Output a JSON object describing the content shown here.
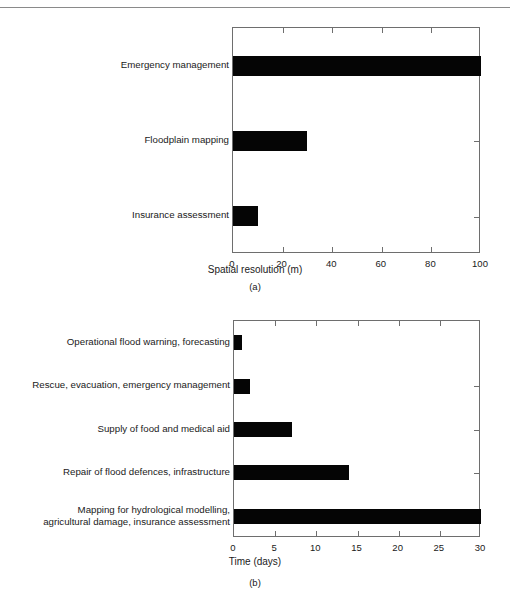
{
  "page": {
    "background_color": "#ffffff",
    "rule_color": "#8a8a8a",
    "bar_color": "#050505",
    "axis_color": "#6e6e6e",
    "text_color": "#1a1a1a",
    "footer_text_clipped": ""
  },
  "chart_data": [
    {
      "type": "bar",
      "orientation": "horizontal",
      "panel": "(a)",
      "title": "",
      "xlabel": "Spatial resolution (m)",
      "ylabel": "",
      "xlim": [
        0,
        100
      ],
      "xticks": [
        "0",
        "20",
        "40",
        "60",
        "80",
        "100"
      ],
      "xtick_values": [
        0,
        20,
        40,
        60,
        80,
        100
      ],
      "grid": false,
      "legend": false,
      "categories": [
        "Emergency management",
        "Floodplain mapping",
        "Insurance assessment"
      ],
      "values": [
        100,
        30,
        10
      ]
    },
    {
      "type": "bar",
      "orientation": "horizontal",
      "panel": "(b)",
      "title": "",
      "xlabel": "Time (days)",
      "ylabel": "",
      "xlim": [
        0,
        30
      ],
      "xticks": [
        "0",
        "5",
        "10",
        "15",
        "20",
        "25",
        "30"
      ],
      "xtick_values": [
        0,
        5,
        10,
        15,
        20,
        25,
        30
      ],
      "grid": false,
      "legend": false,
      "categories": [
        "Operational flood warning, forecasting",
        "Rescue, evacuation, emergency management",
        "Supply of food and medical aid",
        "Repair of flood defences, infrastructure",
        "Mapping for hydrological modelling,\nagricultural damage, insurance assessment"
      ],
      "values": [
        1,
        2,
        7,
        14,
        30
      ]
    }
  ]
}
